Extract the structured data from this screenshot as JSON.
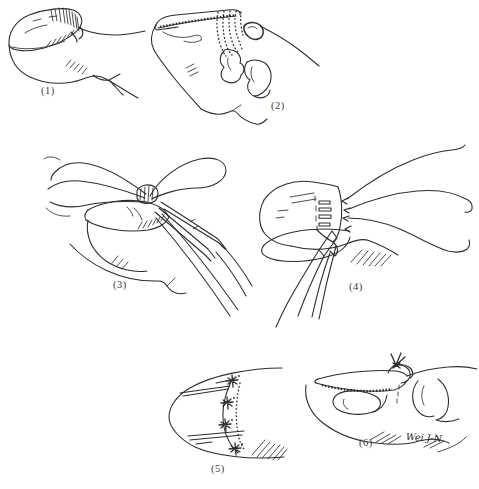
{
  "figure": {
    "background_color": "#ffffff",
    "ink_color": "#2e2e2e",
    "panels": [
      {
        "label": "(1)",
        "illustration": "fingertip-lateral-view-avulsed-nail"
      },
      {
        "label": "(2)",
        "illustration": "nail-plate-lifted-exposed-nail-bed-and-bone"
      },
      {
        "label": "(3)",
        "illustration": "suture-threads-placed-with-needle-holder"
      },
      {
        "label": "(4)",
        "illustration": "nail-repositioned-sutures-drawn-with-forceps"
      },
      {
        "label": "(5)",
        "illustration": "dorsal-view-knots-tied-at-nail-base"
      },
      {
        "label": "(6)",
        "illustration": "lateral-view-nail-secured-over-phalanx"
      }
    ],
    "signature": "Wei J-N"
  }
}
